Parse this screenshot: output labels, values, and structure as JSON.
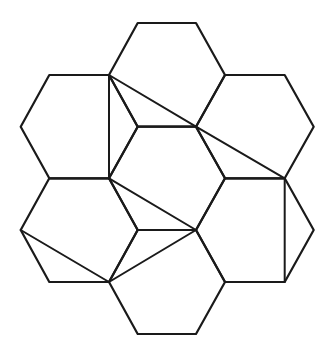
{
  "diagram": {
    "stroke_color": "#1a1a1a",
    "background": "#ffffff",
    "hexagons": [
      {
        "name": "top",
        "points": [
          [
            137.7,
            23
          ],
          [
            196,
            23
          ],
          [
            225,
            75
          ],
          [
            196,
            126.7
          ],
          [
            137.7,
            126.7
          ],
          [
            109,
            75
          ]
        ]
      },
      {
        "name": "upper-left",
        "points": [
          [
            49.3,
            75
          ],
          [
            109,
            75
          ],
          [
            137.7,
            126.7
          ],
          [
            109,
            178.3
          ],
          [
            49.3,
            178.3
          ],
          [
            20.7,
            126.7
          ]
        ]
      },
      {
        "name": "upper-right",
        "points": [
          [
            225,
            75
          ],
          [
            284.7,
            75
          ],
          [
            313.7,
            126.7
          ],
          [
            284.7,
            178.3
          ],
          [
            225,
            178.3
          ],
          [
            196,
            126.7
          ]
        ]
      },
      {
        "name": "center",
        "points": [
          [
            137.7,
            126.7
          ],
          [
            196,
            126.7
          ],
          [
            225,
            178.3
          ],
          [
            196,
            230
          ],
          [
            137.7,
            230
          ],
          [
            109,
            178.3
          ]
        ]
      },
      {
        "name": "lower-left",
        "points": [
          [
            49.3,
            178.3
          ],
          [
            109,
            178.3
          ],
          [
            137.7,
            230
          ],
          [
            109,
            282
          ],
          [
            49.3,
            282
          ],
          [
            20.7,
            230
          ]
        ]
      },
      {
        "name": "lower-right",
        "points": [
          [
            225,
            178.3
          ],
          [
            284.7,
            178.3
          ],
          [
            313.7,
            230
          ],
          [
            284.7,
            282
          ],
          [
            225,
            282
          ],
          [
            196,
            230
          ]
        ]
      },
      {
        "name": "bottom",
        "points": [
          [
            137.7,
            230
          ],
          [
            196,
            230
          ],
          [
            225,
            282
          ],
          [
            196,
            334
          ],
          [
            137.7,
            334
          ],
          [
            109,
            282
          ]
        ]
      }
    ],
    "segments": [
      {
        "name": "vertical-left-upper",
        "from": [
          109,
          75
        ],
        "to": [
          109,
          178.3
        ]
      },
      {
        "name": "diagonal-top",
        "from": [
          109,
          75
        ],
        "to": [
          196,
          126.7
        ]
      },
      {
        "name": "diagonal-right-upper",
        "from": [
          196,
          126.7
        ],
        "to": [
          284.7,
          178.3
        ]
      },
      {
        "name": "vertical-right-lower",
        "from": [
          284.7,
          178.3
        ],
        "to": [
          284.7,
          282
        ]
      },
      {
        "name": "diagonal-center-lower",
        "from": [
          109,
          178.3
        ],
        "to": [
          196,
          230
        ]
      },
      {
        "name": "diagonal-bottom-center",
        "from": [
          196,
          230
        ],
        "to": [
          109,
          282
        ]
      },
      {
        "name": "diagonal-left-lower",
        "from": [
          20.7,
          230
        ],
        "to": [
          109,
          282
        ]
      }
    ]
  }
}
